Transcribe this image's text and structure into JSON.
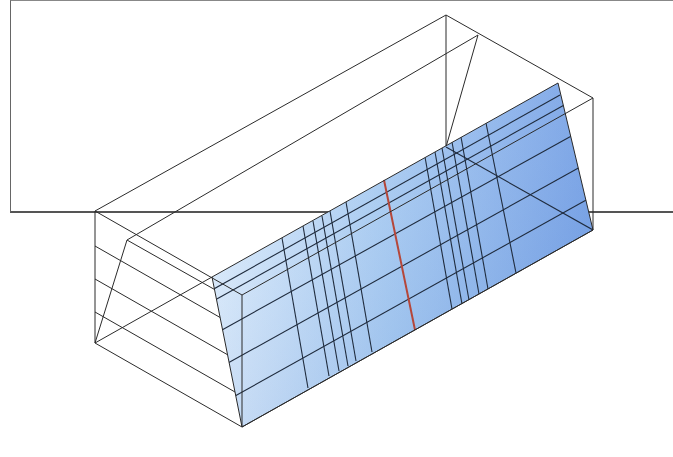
{
  "figure": {
    "colors": {
      "background": "#ffffff",
      "frame_border": "#666666",
      "edge": "#2b2b2b",
      "plane_light": "#dcefff",
      "plane_dark": "#6f9ee6",
      "highlight_line": "#b5473a"
    },
    "box": {
      "top_vertices": [
        [
          95,
          211
        ],
        [
          446,
          15
        ],
        [
          593,
          98
        ],
        [
          242,
          295
        ]
      ],
      "bottom_vertices": [
        [
          95,
          343
        ],
        [
          446,
          147
        ],
        [
          593,
          230
        ],
        [
          242,
          427
        ]
      ]
    },
    "plane": {
      "vertices": [
        [
          212,
          277
        ],
        [
          558,
          83
        ],
        [
          593,
          230
        ],
        [
          242,
          427
        ]
      ]
    },
    "highlight": {
      "from": [
        384,
        180
      ],
      "to": [
        415,
        330
      ]
    }
  }
}
